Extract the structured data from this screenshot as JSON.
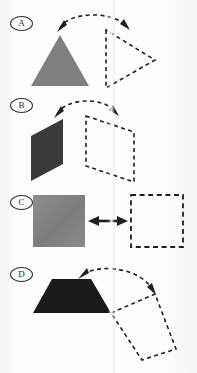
{
  "document": {
    "kind": "scanned-worksheet-figure",
    "page_background": "#fdfdfc",
    "ink_color": "#1f1f1f"
  },
  "panels": [
    {
      "id": "a",
      "label": "A",
      "label_style": "circled-letter",
      "solid_shape": {
        "name": "triangle",
        "fill": "#7f7f7f",
        "description": "filled equilateral triangle pointing up"
      },
      "dashed_shape": {
        "name": "triangle",
        "stroke": "#1f1f1f",
        "description": "dashed triangle rotated to point right"
      },
      "arrow": {
        "name": "rotation-arc",
        "style": "dashed",
        "heads": "both",
        "description": "dashed arc with arrowheads at both ends spanning the two shapes"
      }
    },
    {
      "id": "b",
      "label": "B",
      "label_style": "circled-letter",
      "solid_shape": {
        "name": "parallelogram",
        "fill": "#3a3a3a",
        "description": "filled parallelogram slanting up to the right"
      },
      "dashed_shape": {
        "name": "parallelogram",
        "stroke": "#1f1f1f",
        "description": "dashed parallelogram of matching slant to the right"
      },
      "arrow": {
        "name": "rotation-arc",
        "style": "dashed",
        "heads": "both",
        "description": "dashed arc with arrowheads at both ends"
      }
    },
    {
      "id": "c",
      "label": "C",
      "label_style": "circled-letter",
      "solid_shape": {
        "name": "square",
        "fill": "#808080",
        "description": "filled grey square"
      },
      "dashed_shape": {
        "name": "square",
        "stroke": "#1f1f1f",
        "description": "dashed square outline"
      },
      "arrow": {
        "name": "translation-arrow",
        "style": "solid",
        "heads": "both",
        "description": "solid horizontal double-headed arrow between the two squares"
      }
    },
    {
      "id": "d",
      "label": "D",
      "label_style": "circled-letter",
      "solid_shape": {
        "name": "trapezoid",
        "fill": "#1a1a1a",
        "description": "filled dark trapezoid, wide base, narrow top"
      },
      "dashed_shape": {
        "name": "quadrilateral",
        "stroke": "#1f1f1f",
        "description": "dashed quadrilateral tilted down and to the right"
      },
      "arrow": {
        "name": "rotation-arc",
        "style": "dashed",
        "heads": "both",
        "description": "dashed arc curving from the shape top over to the lower right"
      }
    }
  ]
}
